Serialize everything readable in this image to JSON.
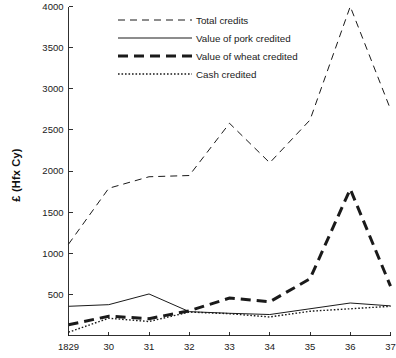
{
  "chart_data": {
    "type": "line",
    "title": "",
    "subtitle": "",
    "xlabel": "",
    "ylabel": "£ (Hfx Cy)",
    "x": [
      "1829",
      "30",
      "31",
      "32",
      "33",
      "34",
      "35",
      "36",
      "37"
    ],
    "x_numeric": [
      1829,
      1830,
      1831,
      1832,
      1833,
      1834,
      1835,
      1836,
      1837
    ],
    "xlim": [
      1829,
      1837
    ],
    "ylim": [
      0,
      4000
    ],
    "y_ticks": [
      500,
      1000,
      1500,
      2000,
      2500,
      3000,
      3500,
      4000
    ],
    "y_tick_labels": [
      "500",
      "1000",
      "1500",
      "2000",
      "2500",
      "3000",
      "3500",
      "4000"
    ],
    "grid": false,
    "legend_position": "top-center",
    "series": [
      {
        "name": "Total credits",
        "style": "dashed",
        "values": [
          1110,
          1790,
          1930,
          1945,
          2580,
          2100,
          2620,
          4000,
          2750
        ]
      },
      {
        "name": "Value of pork credited",
        "style": "solid",
        "values": [
          355,
          375,
          505,
          290,
          270,
          255,
          325,
          395,
          360
        ]
      },
      {
        "name": "Value of wheat credited",
        "style": "thick-dashed",
        "values": [
          130,
          235,
          205,
          300,
          455,
          410,
          690,
          1780,
          600
        ]
      },
      {
        "name": "Cash credited",
        "style": "dotted",
        "values": [
          40,
          210,
          170,
          285,
          265,
          225,
          295,
          325,
          355
        ]
      }
    ]
  },
  "legend": {
    "items": [
      {
        "label": "Total credits",
        "style": "dashed"
      },
      {
        "label": "Value of pork credited",
        "style": "solid"
      },
      {
        "label": "Value of wheat credited",
        "style": "thick-dashed"
      },
      {
        "label": "Cash credited",
        "style": "dotted"
      }
    ]
  },
  "axes": {
    "y_title": "£ (Hfx Cy)"
  }
}
